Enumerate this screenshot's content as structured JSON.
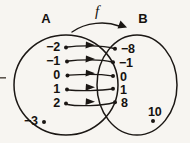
{
  "figure": {
    "type": "function-mapping-diagram",
    "background_color": "#f7f5f1",
    "ink_color": "#1b1714",
    "function_label": "f",
    "sets": {
      "domain": {
        "label": "A",
        "mapped_elements": [
          "−2",
          "−1",
          "0",
          "1",
          "2"
        ],
        "unmapped_elements": [
          "−3"
        ]
      },
      "codomain": {
        "label": "B",
        "mapped_elements": [
          "−8",
          "−1",
          "0",
          "1",
          "8"
        ],
        "unmapped_elements": [
          "10"
        ]
      }
    },
    "mappings": [
      {
        "from": "−2",
        "to": "−8"
      },
      {
        "from": "−1",
        "to": "−1"
      },
      {
        "from": "0",
        "to": "0"
      },
      {
        "from": "1",
        "to": "1"
      },
      {
        "from": "2",
        "to": "8"
      }
    ]
  }
}
